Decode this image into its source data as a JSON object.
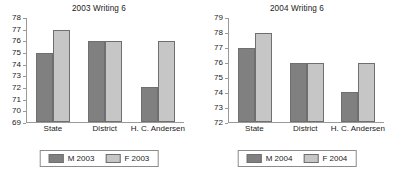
{
  "chart_data": [
    {
      "type": "bar",
      "title": "2003 Writing 6",
      "xlabel": "",
      "ylabel": "",
      "ylim": [
        69,
        78
      ],
      "ytick_step": 1,
      "yticks": [
        78,
        77,
        76,
        75,
        74,
        73,
        72,
        71,
        70,
        69
      ],
      "grid": false,
      "legend_position": "bottom",
      "categories": [
        "State",
        "District",
        "H. C. Andersen"
      ],
      "series": [
        {
          "name": "M 2003",
          "color": "#808080",
          "values": [
            75,
            76,
            72
          ]
        },
        {
          "name": "F 2003",
          "color": "#c6c6c6",
          "values": [
            77,
            76,
            76
          ]
        }
      ]
    },
    {
      "type": "bar",
      "title": "2004 Writing 6",
      "xlabel": "",
      "ylabel": "",
      "ylim": [
        72,
        79
      ],
      "ytick_step": 1,
      "yticks": [
        79,
        78,
        77,
        76,
        75,
        74,
        73,
        72
      ],
      "grid": false,
      "legend_position": "bottom",
      "categories": [
        "State",
        "District",
        "H. C. Andersen"
      ],
      "series": [
        {
          "name": "M 2004",
          "color": "#808080",
          "values": [
            77,
            76,
            74
          ]
        },
        {
          "name": "F 2004",
          "color": "#c6c6c6",
          "values": [
            78,
            76,
            76
          ]
        }
      ]
    }
  ]
}
